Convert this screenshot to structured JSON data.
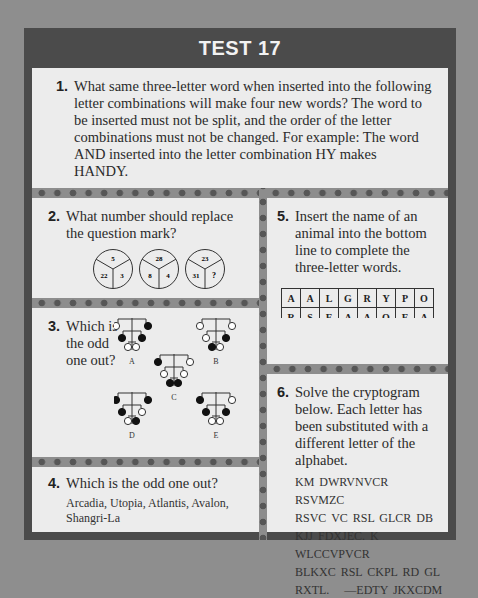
{
  "title": "TEST 17",
  "q1": {
    "number": "1.",
    "text": "What same three-letter word when inserted into the following letter combinations will make four new words? The word to be inserted must not be split, and the order of the letter combinations must not be changed. For example: The word AND inserted into the letter combination HY makes HANDY.",
    "combinations": [
      "ST",
      "ARE",
      "CHIE",
      "SNER"
    ]
  },
  "q2": {
    "number": "2.",
    "text": "What number should replace the question mark?",
    "circles": [
      {
        "top": "5",
        "left": "22",
        "right": "3"
      },
      {
        "top": "28",
        "left": "8",
        "right": "4"
      },
      {
        "top": "23",
        "left": "31",
        "right": "?"
      }
    ]
  },
  "q3": {
    "number": "3.",
    "text": "Which is the odd one out?",
    "figures": [
      {
        "label": "A",
        "row1": [
          "open",
          "filled"
        ],
        "row2": [
          "filled",
          "filled"
        ],
        "row3": [
          "open",
          "open"
        ]
      },
      {
        "label": "B",
        "row1": [
          "open",
          "open"
        ],
        "row2": [
          "open",
          "filled"
        ],
        "row3": [
          "filled",
          "open"
        ]
      },
      {
        "label": "C",
        "row1": [
          "filled",
          "open"
        ],
        "row2": [
          "open",
          "open"
        ],
        "row3": [
          "filled",
          "filled"
        ]
      },
      {
        "label": "D",
        "row1": [
          "filled",
          "filled"
        ],
        "row2": [
          "filled",
          "open"
        ],
        "row3": [
          "open",
          "filled"
        ]
      },
      {
        "label": "E",
        "row1": [
          "filled",
          "open"
        ],
        "row2": [
          "filled",
          "filled"
        ],
        "row3": [
          "open",
          "open"
        ]
      }
    ]
  },
  "q4": {
    "number": "4.",
    "text": "Which is the odd one out?",
    "options": "Arcadia, Utopia, Atlantis, Avalon, Shangri-La"
  },
  "q5": {
    "number": "5.",
    "text": "Insert the name of an animal into the bottom line to complete the three-letter words.",
    "grid": [
      [
        "A",
        "A",
        "L",
        "G",
        "R",
        "Y",
        "P",
        "O"
      ],
      [
        "R",
        "S",
        "E",
        "A",
        "A",
        "O",
        "E",
        "A"
      ],
      [
        "",
        "",
        "",
        "",
        "",
        "",
        "",
        ""
      ]
    ]
  },
  "q6": {
    "number": "6.",
    "text": "Solve the cryptogram below. Each letter has been substituted with a different letter of the alphabet.",
    "cryptogram": [
      "KM DWRVNVCR RSVMZC",
      "RSVC VC RSL GLCR DB",
      "KJJ FDXJEC. K WLCCVPVCR",
      "BLKXC RSL CKPL RD GL",
      "RXTL.   —EDTY JKXCDM"
    ]
  }
}
